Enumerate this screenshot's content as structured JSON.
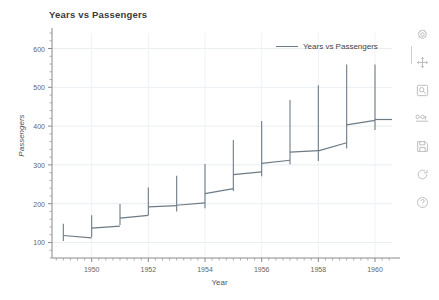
{
  "window": {
    "background": "#ffffff"
  },
  "chart_data": {
    "type": "line",
    "title": "Years vs Passengers",
    "xlabel": "Year",
    "ylabel": "Passengers",
    "grid": true,
    "legend": {
      "position": "top-right",
      "entries": [
        "Years vs Passengers"
      ]
    },
    "series_color": "#6d7b86",
    "xlim": [
      1948.6,
      1960.6
    ],
    "ylim": [
      60,
      640
    ],
    "xticks": [
      1950,
      1952,
      1954,
      1956,
      1958,
      1960
    ],
    "xtick_labels": [
      "1950",
      "1952",
      "1954",
      "1956",
      "1958",
      "1960"
    ],
    "yticks": [
      100,
      200,
      300,
      400,
      500,
      600
    ],
    "ytick_labels": [
      "100",
      "200",
      "300",
      "400",
      "500",
      "600"
    ],
    "x_minor_interval": 0.25,
    "y_minor_interval": 20,
    "series": [
      {
        "name": "Years vs Passengers",
        "points": [
          {
            "year": 1949,
            "start": 118,
            "end": 112,
            "low": 104,
            "high": 148
          },
          {
            "year": 1950,
            "start": 137,
            "end": 142,
            "low": 114,
            "high": 170
          },
          {
            "year": 1951,
            "start": 163,
            "end": 170,
            "low": 145,
            "high": 199
          },
          {
            "year": 1952,
            "start": 192,
            "end": 195,
            "low": 171,
            "high": 242
          },
          {
            "year": 1953,
            "start": 196,
            "end": 202,
            "low": 180,
            "high": 272
          },
          {
            "year": 1954,
            "start": 226,
            "end": 239,
            "low": 188,
            "high": 302
          },
          {
            "year": 1955,
            "start": 275,
            "end": 282,
            "low": 233,
            "high": 364
          },
          {
            "year": 1956,
            "start": 304,
            "end": 312,
            "low": 271,
            "high": 413
          },
          {
            "year": 1957,
            "start": 333,
            "end": 337,
            "low": 301,
            "high": 467
          },
          {
            "year": 1958,
            "start": 336,
            "end": 357,
            "low": 310,
            "high": 505
          },
          {
            "year": 1959,
            "start": 403,
            "end": 415,
            "low": 342,
            "high": 559
          },
          {
            "year": 1960,
            "start": 417,
            "end": 417,
            "low": 390,
            "high": 559
          }
        ]
      }
    ]
  },
  "toolbar": {
    "items": [
      {
        "icon": "settings-gear-icon",
        "name": "settings-button"
      },
      {
        "icon": "move-cross-icon",
        "name": "pan-button"
      },
      {
        "icon": "magnifier-icon",
        "name": "zoom-button"
      },
      {
        "icon": "curve-edit-icon",
        "name": "curve-edit-button"
      },
      {
        "icon": "save-floppy-icon",
        "name": "save-button"
      },
      {
        "icon": "refresh-circle-icon",
        "name": "reset-button"
      },
      {
        "icon": "help-question-icon",
        "name": "help-button"
      }
    ]
  }
}
